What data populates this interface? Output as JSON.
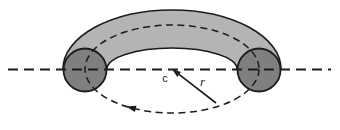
{
  "diagram": {
    "labels": {
      "center": "c",
      "radius": "r"
    },
    "colors": {
      "background": "#ffffff",
      "torus_body": "#b4b4b4",
      "tube_cross_section": "#7f7f7f",
      "line": "#1c1c1c"
    }
  }
}
